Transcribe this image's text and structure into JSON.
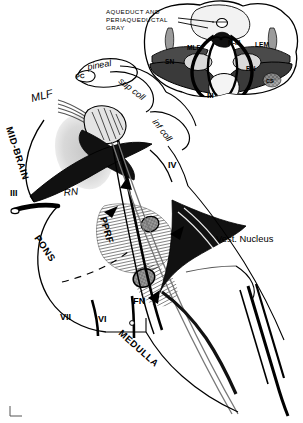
{
  "figure": {
    "background_color": "#ffffff",
    "ink_color": "#000000",
    "midgray_color": "#808080",
    "lightgray_color": "#c8c8c8"
  },
  "inset": {
    "name": "midbrain-cross-section",
    "callout": {
      "line1": "AQUEDUCT AND",
      "line2": "PERIAQUEDUCTAL",
      "line3": "GRAY"
    },
    "labels": [
      {
        "id": "mlf",
        "text": "MLF"
      },
      {
        "id": "n3",
        "text": "N-III"
      },
      {
        "id": "lem",
        "text": "LEM"
      },
      {
        "id": "sn",
        "text": "SN"
      },
      {
        "id": "rn",
        "text": "RN"
      },
      {
        "id": "cs",
        "text": "CS"
      }
    ]
  },
  "main": {
    "labels": [
      {
        "id": "pineal",
        "text": "pineal"
      },
      {
        "id": "pc",
        "text": "PC"
      },
      {
        "id": "sup-coll",
        "text": "sup coll"
      },
      {
        "id": "inf-coll",
        "text": "inf coll"
      },
      {
        "id": "mlf",
        "text": "MLF"
      },
      {
        "id": "midbrain",
        "text": "MID-BRAIN"
      },
      {
        "id": "nerve-3",
        "text": "III"
      },
      {
        "id": "nerve-3b",
        "text": "III"
      },
      {
        "id": "nerve-4",
        "text": "IV"
      },
      {
        "id": "rn",
        "text": "RN"
      },
      {
        "id": "pons",
        "text": "PONS"
      },
      {
        "id": "pprf",
        "text": "PPRF"
      },
      {
        "id": "fn",
        "text": "FN"
      },
      {
        "id": "nerve-7",
        "text": "VII"
      },
      {
        "id": "nerve-6",
        "text": "VI"
      },
      {
        "id": "vest-nucleus",
        "text": "Vest. Nucleus"
      },
      {
        "id": "medulla",
        "text": "MEDULLA"
      }
    ]
  }
}
